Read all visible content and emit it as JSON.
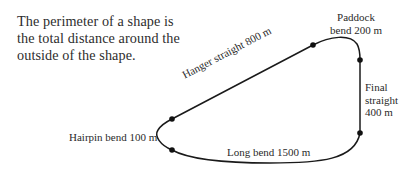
{
  "intro_text": {
    "lines": [
      "The perimeter of a shape is",
      "the total distance around the",
      "outside of the shape."
    ]
  },
  "track": {
    "segments": [
      {
        "id": "paddock_bend",
        "label_lines": [
          "Paddock",
          "bend 200 m"
        ],
        "length_m": 200
      },
      {
        "id": "final_straight",
        "label_lines": [
          "Final",
          "straight",
          "400 m"
        ],
        "length_m": 400
      },
      {
        "id": "long_bend",
        "label": "Long bend 1500 m",
        "length_m": 1500
      },
      {
        "id": "hairpin_bend",
        "label": "Hairpin bend 100 m",
        "length_m": 100
      },
      {
        "id": "hanger_straight",
        "label": "Hanger straight 800 m",
        "length_m": 800
      }
    ],
    "line_color": "#1a1a1a"
  }
}
